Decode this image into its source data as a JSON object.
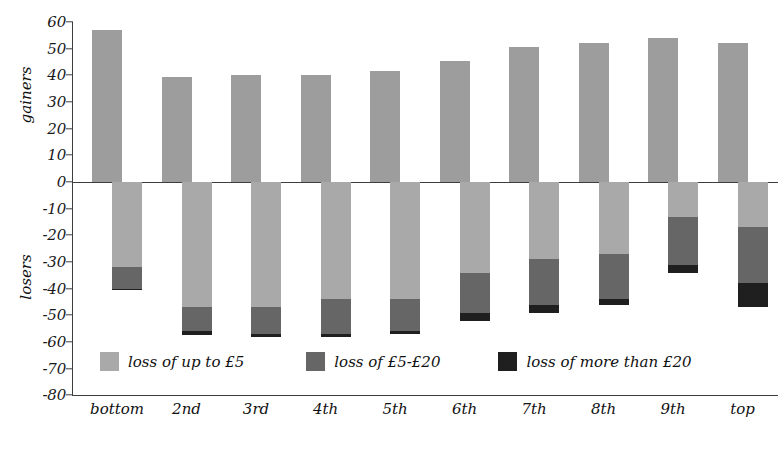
{
  "chart_data": {
    "type": "bar",
    "subtype": "diverging-stacked-bar",
    "title": "",
    "xlabel": "",
    "ylabel": "",
    "axis_titles": {
      "positive": "gainers",
      "negative": "losers"
    },
    "categories": [
      "bottom",
      "2nd",
      "3rd",
      "4th",
      "5th",
      "6th",
      "7th",
      "8th",
      "9th",
      "top"
    ],
    "ylim": [
      -80,
      60
    ],
    "yticks": [
      60,
      50,
      40,
      30,
      20,
      10,
      0,
      -10,
      -20,
      -30,
      -40,
      -50,
      -60,
      -70,
      -80
    ],
    "ytick_labels": [
      "60",
      "50",
      "40",
      "30",
      "20",
      "10",
      "0",
      "-10",
      "-20",
      "-30",
      "-40",
      "-50",
      "-60",
      "-70",
      "-80"
    ],
    "grid": false,
    "legend_position": "inside-bottom-left",
    "series": [
      {
        "name": "gainers",
        "color": "#9d9d9d",
        "values": [
          57,
          39.5,
          40,
          40,
          41.5,
          45.5,
          50.5,
          52,
          54,
          52
        ]
      },
      {
        "name": "loss of up to £5",
        "color": "#a9a9a9",
        "values": [
          -32,
          -47,
          -47,
          -44,
          -44,
          -34,
          -29,
          -27,
          -13,
          -17
        ]
      },
      {
        "name": "loss of £5-£20",
        "color": "#666666",
        "values": [
          -8,
          -9,
          -10,
          -13,
          -12,
          -15,
          -17,
          -17,
          -18,
          -21
        ]
      },
      {
        "name": "loss of more than £20",
        "color": "#1f1f1f",
        "values": [
          -0.5,
          -1.5,
          -1,
          -1,
          -1,
          -3,
          -3,
          -2,
          -3,
          -9
        ]
      }
    ],
    "cumulative_negative_totals": [
      -40.5,
      -57.5,
      -58,
      -58,
      -57,
      -52,
      -49,
      -46,
      -34,
      -47
    ]
  },
  "legend": {
    "items": [
      {
        "label": "loss of up to £5",
        "color": "#a9a9a9",
        "swatch_name": "legend-swatch-light"
      },
      {
        "label": "loss of £5-£20",
        "color": "#666666",
        "swatch_name": "legend-swatch-mid"
      },
      {
        "label": "loss of more than £20",
        "color": "#1f1f1f",
        "swatch_name": "legend-swatch-dark"
      }
    ]
  },
  "colors": {
    "axis": "#3d3d3d",
    "text": "#111111",
    "background": "#ffffff",
    "gainers_bar": "#9d9d9d"
  }
}
